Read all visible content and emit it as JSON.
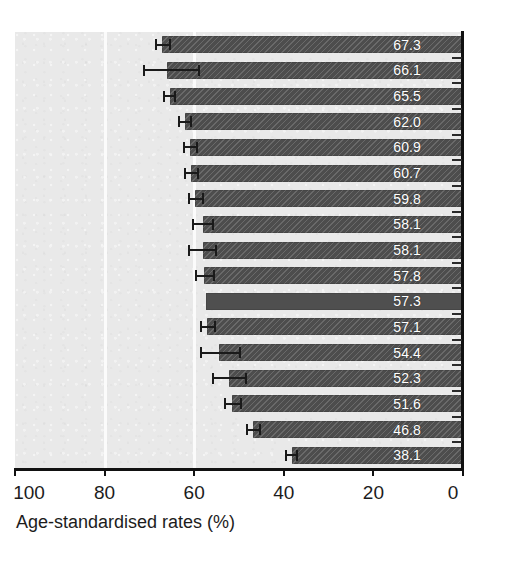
{
  "chart_data": {
    "type": "bar",
    "orientation": "horizontal",
    "title": "",
    "subtitle": "",
    "xlabel": "Age-standardised rates (%)",
    "ylabel": "",
    "xlim": [
      100,
      0
    ],
    "x_axis_reversed": true,
    "xticks": [
      100,
      80,
      60,
      40,
      20,
      0
    ],
    "xticklabels": [
      "100",
      "80",
      "60",
      "40",
      "20",
      "0"
    ],
    "grid": "vertical-gridlines-at-80-and-60",
    "legend": "none",
    "categories": [
      "",
      "",
      "",
      "",
      "",
      "",
      "",
      "",
      "",
      "",
      "",
      "",
      "",
      "",
      "",
      "",
      ""
    ],
    "values": [
      67.3,
      66.1,
      65.5,
      62.0,
      60.9,
      60.7,
      59.8,
      58.1,
      58.1,
      57.8,
      57.3,
      57.1,
      54.4,
      52.3,
      51.6,
      46.8,
      38.1
    ],
    "data_labels": [
      "67.3",
      "66.1",
      "65.5",
      "62.0",
      "60.9",
      "60.7",
      "59.8",
      "58.1",
      "58.1",
      "57.8",
      "57.3",
      "57.1",
      "54.4",
      "52.3",
      "51.6",
      "46.8",
      "38.1"
    ],
    "error_low": [
      65.5,
      59.0,
      64.3,
      60.7,
      59.4,
      59.2,
      58.0,
      55.9,
      55.1,
      55.6,
      null,
      55.3,
      49.8,
      48.5,
      49.6,
      45.4,
      37.1
    ],
    "error_high": [
      68.6,
      71.1,
      66.7,
      63.3,
      62.3,
      62.0,
      61.2,
      60.3,
      61.1,
      59.7,
      null,
      58.4,
      58.5,
      55.8,
      53.2,
      48.3,
      39.5
    ],
    "bar_styles": [
      "hatched",
      "hatched",
      "hatched",
      "hatched",
      "hatched",
      "hatched",
      "hatched",
      "hatched",
      "hatched",
      "hatched",
      "solid",
      "hatched",
      "hatched",
      "hatched",
      "hatched",
      "hatched",
      "hatched"
    ],
    "has_error_bars": [
      true,
      true,
      true,
      true,
      true,
      true,
      true,
      true,
      true,
      true,
      false,
      true,
      true,
      true,
      true,
      true,
      true
    ]
  },
  "style": {
    "panel_background": "#e9e9e9",
    "gridline_color": "#fbfbfb",
    "bar_color": "#4d4d4d",
    "bar_label_color": "#ffffff",
    "axis_color": "#111111",
    "error_bar_color": "#1a1a1a",
    "page_background": "#ffffff"
  }
}
